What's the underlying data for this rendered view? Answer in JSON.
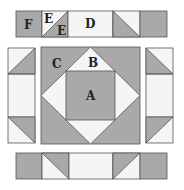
{
  "colors": {
    "gray": "#a9a9a9",
    "white": "#f5f5f5",
    "stroke": "#555555"
  },
  "labels": {
    "A": "A",
    "B": "B",
    "C": "C",
    "D": "D",
    "E1": "E",
    "E2": "E",
    "F": "F"
  }
}
